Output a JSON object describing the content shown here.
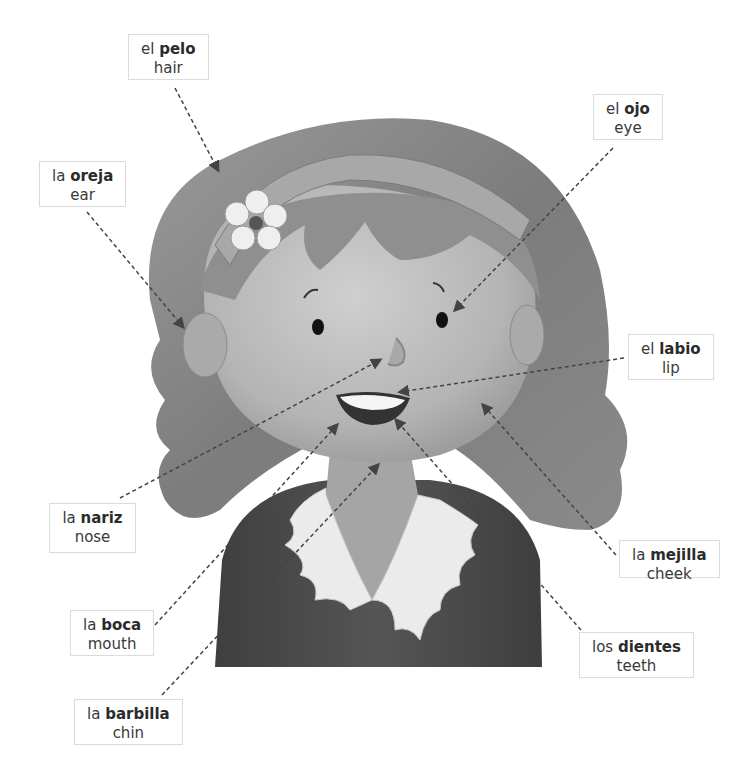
{
  "diagram": {
    "labels": [
      {
        "id": "pelo",
        "article": "el",
        "spanish": "pelo",
        "english": "hair",
        "box": [
          128,
          34,
          64,
          46
        ]
      },
      {
        "id": "oreja",
        "article": "la",
        "spanish": "oreja",
        "english": "ear",
        "box": [
          39,
          161,
          84,
          46
        ]
      },
      {
        "id": "ojo",
        "article": "el",
        "spanish": "ojo",
        "english": "eye",
        "box": [
          593,
          94,
          64,
          46
        ]
      },
      {
        "id": "labio",
        "article": "el",
        "spanish": "labio",
        "english": "lip",
        "box": [
          628,
          334,
          82,
          46
        ]
      },
      {
        "id": "nariz",
        "article": "la",
        "spanish": "nariz",
        "english": "nose",
        "box": [
          49,
          503,
          87,
          50
        ]
      },
      {
        "id": "boca",
        "article": "la",
        "spanish": "boca",
        "english": "mouth",
        "box": [
          70,
          610,
          80,
          46
        ]
      },
      {
        "id": "barbilla",
        "article": "la",
        "spanish": "barbilla",
        "english": "chin",
        "box": [
          74,
          699,
          108,
          46
        ]
      },
      {
        "id": "mejilla",
        "article": "la",
        "spanish": "mejilla",
        "english": "cheek",
        "box": [
          619,
          540,
          99,
          38
        ]
      },
      {
        "id": "dientes",
        "article": "los",
        "spanish": "dientes",
        "english": "teeth",
        "box": [
          579,
          632,
          111,
          46
        ]
      }
    ],
    "leaders": [
      {
        "for": "pelo",
        "from": [
          175,
          88
        ],
        "to": [
          218,
          170
        ]
      },
      {
        "for": "oreja",
        "from": [
          87,
          212
        ],
        "to": [
          183,
          327
        ]
      },
      {
        "for": "ojo",
        "from": [
          613,
          148
        ],
        "to": [
          455,
          310
        ]
      },
      {
        "for": "labio",
        "from": [
          624,
          358
        ],
        "to": [
          400,
          392
        ]
      },
      {
        "for": "nariz",
        "from": [
          120,
          498
        ],
        "to": [
          380,
          360
        ]
      },
      {
        "for": "boca",
        "from": [
          155,
          625
        ],
        "to": [
          337,
          425
        ]
      },
      {
        "for": "barbilla",
        "from": [
          162,
          695
        ],
        "to": [
          378,
          465
        ]
      },
      {
        "for": "mejilla",
        "from": [
          616,
          555
        ],
        "to": [
          483,
          405
        ]
      },
      {
        "for": "dientes",
        "from": [
          581,
          630
        ],
        "to": [
          396,
          420
        ]
      }
    ],
    "colors": {
      "hair": "#8c8c8c",
      "hair_dark": "#6b6b6b",
      "skin": "#b5b5b5",
      "skin_light": "#c8c8c8",
      "shirt": "#4e4e4e",
      "collar": "#ececec",
      "headband": "#a0a0a0",
      "leader": "#444444"
    }
  }
}
